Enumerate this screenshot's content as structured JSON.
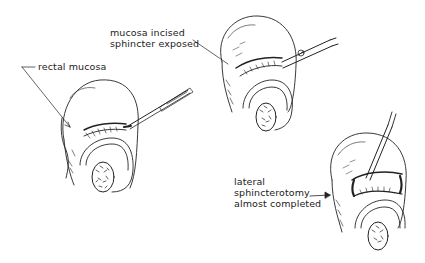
{
  "figure": {
    "panels": [
      {
        "id": "panel-1",
        "description": "initial incision with scalpel",
        "labels": [
          "rectal mucosa"
        ]
      },
      {
        "id": "panel-2",
        "description": "mucosa incised with scissors",
        "labels": [
          "mucosa incised",
          "sphincter exposed"
        ]
      },
      {
        "id": "panel-3",
        "description": "sphincterotomy with forceps",
        "labels": [
          "lateral",
          "sphincterotomy",
          "almost completed"
        ]
      }
    ],
    "colors": {
      "ink": "#222222",
      "background": "#ffffff"
    }
  }
}
